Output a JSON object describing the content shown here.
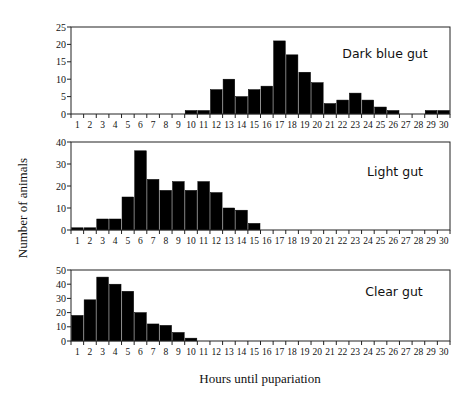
{
  "chart_data": {
    "type": "bar",
    "ylabel": "Number of animals",
    "xlabel": "Hours until pupariation",
    "x": [
      1,
      2,
      3,
      4,
      5,
      6,
      7,
      8,
      9,
      10,
      11,
      12,
      13,
      14,
      15,
      16,
      17,
      18,
      19,
      20,
      21,
      22,
      23,
      24,
      25,
      26,
      27,
      28,
      29,
      30
    ],
    "panels": [
      {
        "title": "Dark blue gut",
        "ylim": [
          0,
          25
        ],
        "yticks": [
          0,
          5,
          10,
          15,
          20,
          25
        ],
        "values": [
          0,
          0,
          0,
          0,
          0,
          0,
          0,
          0,
          0,
          1,
          1,
          7,
          10,
          5,
          7,
          8,
          21,
          17,
          12,
          9,
          3,
          4,
          6,
          4,
          2,
          1,
          0,
          0,
          1,
          1
        ]
      },
      {
        "title": "Light gut",
        "ylim": [
          0,
          40
        ],
        "yticks": [
          0,
          10,
          20,
          30,
          40
        ],
        "values": [
          1,
          1,
          5,
          5,
          15,
          36,
          23,
          18,
          22,
          18,
          22,
          17,
          10,
          9,
          3,
          0,
          0,
          0,
          0,
          0,
          0,
          0,
          0,
          0,
          0,
          0,
          0,
          0,
          0,
          0
        ]
      },
      {
        "title": "Clear gut",
        "ylim": [
          0,
          50
        ],
        "yticks": [
          0,
          10,
          20,
          30,
          40,
          50
        ],
        "values": [
          18,
          29,
          45,
          40,
          35,
          20,
          12,
          11,
          6,
          2,
          0,
          0,
          0,
          0,
          0,
          0,
          0,
          0,
          0,
          0,
          0,
          0,
          0,
          0,
          0,
          0,
          0,
          0,
          0,
          0
        ]
      }
    ],
    "grid": false,
    "legend": "none"
  }
}
